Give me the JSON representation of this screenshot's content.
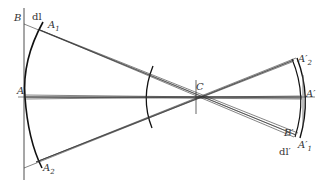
{
  "diagram": {
    "type": "optical-imaging-ray-diagram",
    "colors": {
      "line": "#1a1a1a",
      "thin": "#444444",
      "label": "#333333",
      "background": "#ffffff"
    },
    "labels": {
      "B": "B",
      "dl": "dl",
      "A1": "A",
      "A1_sub": "1",
      "A": "A",
      "A2": "A",
      "A2_sub": "2",
      "C": "C",
      "A2p": "A′",
      "A2p_sub": "2",
      "Ap": "A′",
      "Bp": "B′",
      "A1p": "A′",
      "A1p_sub": "1",
      "dlp": "dl′"
    }
  }
}
